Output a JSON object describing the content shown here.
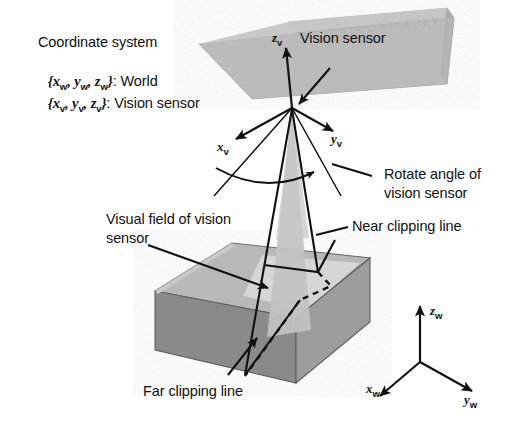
{
  "figure": {
    "type": "technical-diagram",
    "title_absent": true,
    "background_color": "#ffffff",
    "ink_color": "#111111"
  },
  "legend": {
    "heading": "Coordinate system",
    "world_prefix": "{",
    "world_axes": [
      "x",
      "y",
      "z"
    ],
    "world_sub": "w",
    "world_suffix": "}: World",
    "world_label": "World",
    "sensor_sub": "v",
    "sensor_suffix": "}: Vision sensor",
    "sensor_label": "Vision sensor",
    "line1": "Coordinate system",
    "line2": "{x_w, y_w, z_w}: World",
    "line3": "{x_v, y_v, z_v}: Vision sensor"
  },
  "labels": {
    "vision_sensor": "Vision sensor",
    "rotate_angle_l1": "Rotate angle of",
    "rotate_angle_l2": "vision sensor",
    "near_clipping": "Near clipping line",
    "visual_field_l1": "Visual field of vision",
    "visual_field_l2": "sensor",
    "far_clipping": "Far clipping line"
  },
  "axes": {
    "sensor": {
      "z": "z",
      "z_sub": "v",
      "x": "x",
      "x_sub": "v",
      "y": "y",
      "y_sub": "v"
    },
    "world": {
      "z": "z",
      "z_sub": "w",
      "x": "x",
      "x_sub": "w",
      "y": "y",
      "y_sub": "w"
    }
  },
  "watermark": {
    "text": "LATEX VICTORY"
  },
  "colors": {
    "box_top_face": "#b8b8b8",
    "box_top_lit_patch": "#d2d2d2",
    "box_front_left_face": "#8a8a8a",
    "box_front_right_face": "#9a9a9a",
    "sensor_plate": "#bdbdbd",
    "sensor_plate_edge": "#a6a6a6",
    "frustum_fill": "#c0c0c0",
    "line_color": "#111111"
  },
  "geometry_notes": {
    "sensor_origin": [
      292,
      108
    ],
    "frustum_apex": [
      292,
      108
    ],
    "world_origin": [
      420,
      360
    ]
  }
}
